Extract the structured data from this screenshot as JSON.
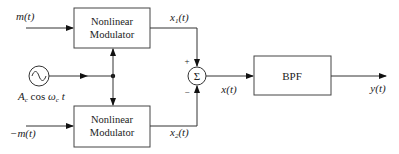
{
  "diagram": {
    "inputs": {
      "top": "m(t)",
      "bottom": "−m(t)",
      "carrier": "A₂ cos ω₂ t"
    },
    "carrier_label": {
      "A": "A",
      "sub_c1": "c",
      "cos": " cos ",
      "omega": "ω",
      "sub_c2": "c",
      "t": " t"
    },
    "blocks": {
      "top_modulator": [
        "Nonlinear",
        "Modulator"
      ],
      "bottom_modulator": [
        "Nonlinear",
        "Modulator"
      ],
      "filter": "BPF"
    },
    "signals": {
      "x1": "x",
      "x1_sub": "1",
      "x1_t": "(t)",
      "x2": "x",
      "x2_sub": "2",
      "x2_t": "(t)",
      "sum_out": "x(t)",
      "output": "y(t)"
    },
    "summer": {
      "symbol": "Σ",
      "top_sign": "+",
      "bottom_sign": "−"
    }
  }
}
